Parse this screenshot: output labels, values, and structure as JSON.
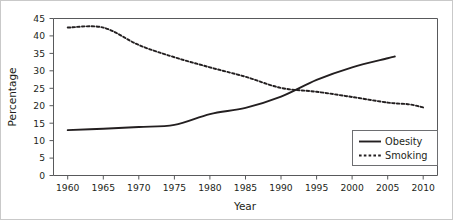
{
  "chart_data": {
    "type": "line",
    "title": "",
    "xlabel": "Year",
    "ylabel": "Percentage",
    "xlim": [
      1958,
      2012
    ],
    "ylim": [
      0,
      45
    ],
    "xticks": [
      1960,
      1965,
      1970,
      1975,
      1980,
      1985,
      1990,
      1995,
      2000,
      2005,
      2010
    ],
    "yticks": [
      0,
      5,
      10,
      15,
      20,
      25,
      30,
      35,
      40,
      45
    ],
    "grid": false,
    "legend_position": "lower right",
    "series": [
      {
        "name": "Obesity",
        "style": "solid",
        "color": "#231f20",
        "x": [
          1960,
          1965,
          1970,
          1975,
          1980,
          1985,
          1990,
          1995,
          2000,
          2005,
          2006
        ],
        "values": [
          13.0,
          13.4,
          13.9,
          14.5,
          17.6,
          19.4,
          22.6,
          27.4,
          31.0,
          33.6,
          34.1
        ]
      },
      {
        "name": "Smoking",
        "style": "dashed",
        "color": "#231f20",
        "x": [
          1960,
          1965,
          1970,
          1975,
          1980,
          1985,
          1990,
          1995,
          2000,
          2005,
          2008,
          2010
        ],
        "values": [
          42.4,
          42.4,
          37.4,
          33.9,
          31.0,
          28.3,
          25.1,
          24.0,
          22.5,
          20.9,
          20.4,
          19.5
        ]
      }
    ],
    "annotations": {
      "crossover_year": 1992,
      "crossover_value": 24.0
    }
  },
  "legend": {
    "entries": [
      {
        "label": "Obesity",
        "style": "solid"
      },
      {
        "label": "Smoking",
        "style": "dashed"
      }
    ]
  },
  "axes": {
    "x_title": "Year",
    "y_title": "Percentage",
    "x_tick_labels": [
      "1960",
      "1965",
      "1970",
      "1975",
      "1980",
      "1985",
      "1990",
      "1995",
      "2000",
      "2005",
      "2010"
    ],
    "y_tick_labels": [
      "0",
      "5",
      "10",
      "15",
      "20",
      "25",
      "30",
      "35",
      "40",
      "45"
    ]
  }
}
